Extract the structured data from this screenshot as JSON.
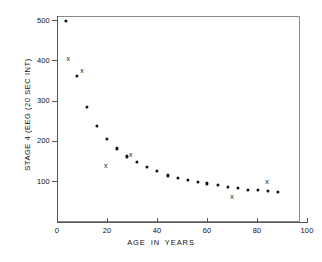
{
  "chart_data": {
    "type": "scatter",
    "title": "",
    "xlabel": "AGE  IN  YEARS",
    "ylabel": "STAGE 4 (EEG (20 SEC INT)",
    "xlim": [
      0,
      100
    ],
    "ylim": [
      0,
      500
    ],
    "grid": false,
    "legend": "none",
    "xticks": [
      0,
      20,
      40,
      60,
      80,
      100
    ],
    "xtick_labels": [
      "0",
      "20",
      "40",
      "60",
      "80",
      "100"
    ],
    "yticks": [
      100,
      200,
      300,
      400,
      500
    ],
    "ytick_labels": [
      "100",
      "200",
      "300",
      "400",
      "500"
    ],
    "series": [
      {
        "name": "mean values",
        "marker": "filled-circle",
        "points": [
          {
            "x": 3.5,
            "y": 498
          },
          {
            "x": 8,
            "y": 362
          },
          {
            "x": 12,
            "y": 285
          },
          {
            "x": 16,
            "y": 237
          },
          {
            "x": 20,
            "y": 204
          },
          {
            "x": 24,
            "y": 181
          },
          {
            "x": 28,
            "y": 161
          },
          {
            "x": 32,
            "y": 147
          },
          {
            "x": 36,
            "y": 135
          },
          {
            "x": 40,
            "y": 124
          },
          {
            "x": 44.5,
            "y": 114
          },
          {
            "x": 48.5,
            "y": 108
          },
          {
            "x": 52.5,
            "y": 103
          },
          {
            "x": 56.5,
            "y": 98
          },
          {
            "x": 60,
            "y": 94
          },
          {
            "x": 64.5,
            "y": 90
          },
          {
            "x": 68.5,
            "y": 86
          },
          {
            "x": 72.5,
            "y": 82
          },
          {
            "x": 76.5,
            "y": 79
          },
          {
            "x": 80.5,
            "y": 78
          },
          {
            "x": 84.5,
            "y": 75
          },
          {
            "x": 88.5,
            "y": 72
          }
        ]
      },
      {
        "name": "individual values",
        "marker": "x",
        "points": [
          {
            "x": 4.5,
            "y": 405
          },
          {
            "x": 10,
            "y": 375
          },
          {
            "x": 19.5,
            "y": 141
          },
          {
            "x": 29.5,
            "y": 168
          },
          {
            "x": 70,
            "y": 64
          },
          {
            "x": 84,
            "y": 101
          }
        ]
      }
    ]
  }
}
